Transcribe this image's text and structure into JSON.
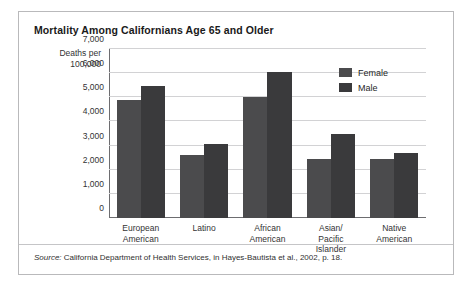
{
  "figure": {
    "title": "Mortality Among Californians Age 65 and Older",
    "axis_caption_line1": "Deaths per",
    "axis_caption_line2": "100,000",
    "source_label": "Source:",
    "source_text": "California Department of Health Services, in Hayes-Bautista et al., 2002, p. 18.",
    "frame_border_color": "#b9b9bb",
    "background_color": "#ffffff"
  },
  "chart_data": {
    "type": "bar",
    "title": "Mortality Among Californians Age 65 and Older",
    "xlabel": "",
    "ylabel": "Deaths per 100,000",
    "ylim": [
      0,
      7000
    ],
    "ytick_values": [
      0,
      1000,
      2000,
      3000,
      4000,
      5000,
      6000,
      7000
    ],
    "ytick_labels": [
      "0",
      "1,000",
      "2,000",
      "3,000",
      "4,000",
      "5,000",
      "6,000",
      "7,000"
    ],
    "grid": true,
    "legend_position": "top-right",
    "categories": [
      "European American",
      "Latino",
      "African American",
      "Asian/ Pacific Islander",
      "Native American"
    ],
    "category_label_lines": [
      [
        "European",
        "American"
      ],
      [
        "Latino"
      ],
      [
        "African",
        "American"
      ],
      [
        "Asian/",
        "Pacific",
        "Islander"
      ],
      [
        "Native",
        "American"
      ]
    ],
    "series": [
      {
        "name": "Female",
        "color": "#4b4b4d",
        "values": [
          4880,
          2600,
          5030,
          2450,
          2430
        ]
      },
      {
        "name": "Male",
        "color": "#3a3a3c",
        "values": [
          5450,
          3050,
          6050,
          3480,
          2680
        ]
      }
    ]
  }
}
